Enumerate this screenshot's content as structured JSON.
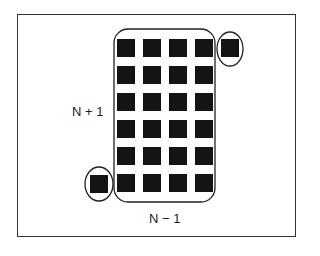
{
  "diagram": {
    "labels": {
      "left": "N + 1",
      "bottom": "N − 1"
    },
    "grid": {
      "columns": 4,
      "rows": 6,
      "col_x": [
        117,
        143,
        169,
        195
      ],
      "row_y": [
        39,
        66,
        93,
        120,
        147,
        174
      ],
      "square_size": 18
    },
    "extra_squares": [
      {
        "name": "top-right-outlier",
        "x": 221,
        "y": 39,
        "ellipse": {
          "cx": 230,
          "cy": 49,
          "rx": 13,
          "ry": 17
        }
      },
      {
        "name": "bottom-left-outlier",
        "x": 90,
        "y": 175,
        "ellipse": {
          "cx": 99,
          "cy": 184,
          "rx": 14,
          "ry": 17
        }
      }
    ],
    "group_outline": {
      "x": 114,
      "y": 29,
      "width": 101,
      "height": 173,
      "radius": 14
    },
    "colors": {
      "square": "#141414",
      "stroke": "#222222",
      "frame": "#333333",
      "background": "#ffffff"
    }
  }
}
